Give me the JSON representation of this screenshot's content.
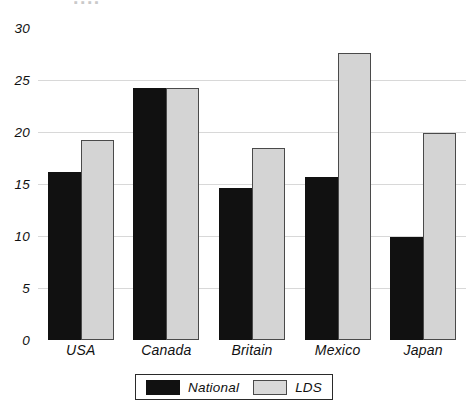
{
  "chart_data": {
    "type": "bar",
    "title": "",
    "xlabel": "",
    "ylabel": "",
    "ylim": [
      0,
      30
    ],
    "ytick_step": 5,
    "yticks": [
      0,
      5,
      10,
      15,
      20,
      25,
      30
    ],
    "ytick_labels": [
      "0",
      "5",
      "10",
      "15",
      "20",
      "25",
      "30"
    ],
    "grid": true,
    "grid_axis": "y",
    "legend_position": "bottom-center",
    "categories": [
      "USA",
      "Canada",
      "Britain",
      "Mexico",
      "Japan"
    ],
    "series": [
      {
        "name": "National",
        "color": "#111111",
        "values": [
          16.2,
          24.2,
          14.6,
          15.7,
          9.9
        ]
      },
      {
        "name": "LDS",
        "color": "#d4d4d4",
        "values": [
          19.2,
          24.2,
          18.5,
          27.6,
          19.9
        ]
      }
    ]
  },
  "axis": {
    "y_labels": [
      "30",
      "25",
      "20",
      "15",
      "10",
      "5",
      "0"
    ]
  },
  "categories": {
    "items": [
      {
        "label": "USA"
      },
      {
        "label": "Canada"
      },
      {
        "label": "Britain"
      },
      {
        "label": "Mexico"
      },
      {
        "label": "Japan"
      }
    ]
  },
  "legend": {
    "entries": [
      {
        "label": "National",
        "swatch": "black-square-swatch"
      },
      {
        "label": "LDS",
        "swatch": "gray-square-swatch"
      }
    ]
  },
  "colors": {
    "national_fill": "#111111",
    "lds_fill": "#d4d4d4",
    "lds_stroke": "#4a4a4a",
    "frame": "#3a3a3a",
    "gridline": "#d8d8d8",
    "background": "#ffffff",
    "text": "#111111"
  },
  "clipped_header": {
    "text": "▪ ▪ ▪ ▪"
  }
}
